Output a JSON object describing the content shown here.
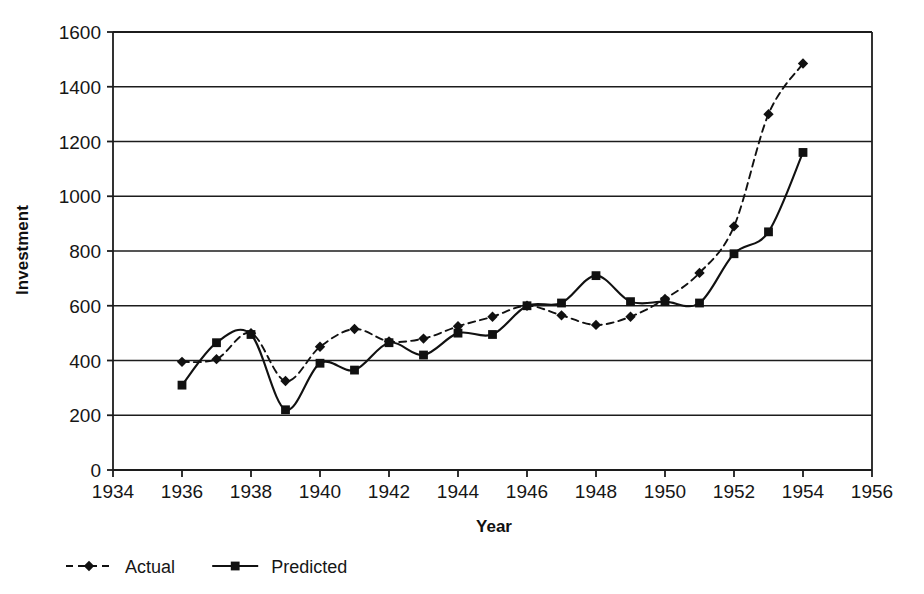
{
  "chart_data": {
    "type": "line",
    "title": "",
    "xlabel": "Year",
    "ylabel": "Investment",
    "xlim": [
      1934,
      1956
    ],
    "ylim": [
      0,
      1600
    ],
    "xticks": [
      1934,
      1936,
      1938,
      1940,
      1942,
      1944,
      1946,
      1948,
      1950,
      1952,
      1954,
      1956
    ],
    "yticks": [
      0,
      200,
      400,
      600,
      800,
      1000,
      1200,
      1400,
      1600
    ],
    "grid": "horizontal",
    "legend_position": "below-axis-left",
    "x": [
      1936,
      1937,
      1938,
      1939,
      1940,
      1941,
      1942,
      1943,
      1944,
      1945,
      1946,
      1947,
      1948,
      1949,
      1950,
      1951,
      1952,
      1953,
      1954
    ],
    "series": [
      {
        "name": "Actual",
        "style": "dashed",
        "marker": "diamond",
        "color": "#111111",
        "values": [
          395,
          405,
          500,
          325,
          450,
          515,
          470,
          480,
          525,
          560,
          600,
          565,
          530,
          560,
          625,
          720,
          890,
          1300,
          1485
        ]
      },
      {
        "name": "Predicted",
        "style": "solid",
        "marker": "square",
        "color": "#111111",
        "values": [
          310,
          465,
          495,
          220,
          390,
          365,
          465,
          420,
          500,
          495,
          600,
          610,
          710,
          615,
          615,
          610,
          790,
          870,
          1160
        ]
      }
    ]
  },
  "axes": {
    "y_title": "Investment",
    "x_title": "Year",
    "y_tick_labels": [
      "1600",
      "1400",
      "1200",
      "1000",
      "800",
      "600",
      "400",
      "200",
      "0"
    ],
    "x_tick_labels": [
      "1934",
      "1936",
      "1938",
      "1940",
      "1942",
      "1944",
      "1946",
      "1948",
      "1950",
      "1952",
      "1954",
      "1956"
    ]
  },
  "legend": {
    "items": [
      {
        "label": "Actual",
        "marker": "diamond-marker",
        "line": "dashed"
      },
      {
        "label": "Predicted",
        "marker": "square-marker",
        "line": "solid"
      }
    ]
  }
}
